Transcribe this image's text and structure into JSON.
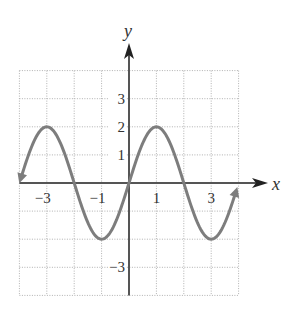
{
  "chart_data": {
    "type": "line",
    "title": "",
    "xlabel": "x",
    "ylabel": "y",
    "xlim": [
      -4,
      4
    ],
    "ylim": [
      -4,
      4
    ],
    "grid": true,
    "grid_style": "dotted",
    "x_tick_labels": [
      {
        "value": -3,
        "label": "−3"
      },
      {
        "value": -1,
        "label": "−1"
      },
      {
        "value": 1,
        "label": "1"
      },
      {
        "value": 3,
        "label": "3"
      }
    ],
    "y_tick_labels": [
      {
        "value": 3,
        "label": "3"
      },
      {
        "value": 2,
        "label": "2"
      },
      {
        "value": 1,
        "label": "1"
      },
      {
        "value": -3,
        "label": "−3"
      }
    ],
    "series": [
      {
        "name": "y = 2 sin(πx/2)",
        "function": "2*sin(pi*x/2)",
        "x_range": [
          -3.95,
          3.9
        ],
        "arrows_at_ends": true,
        "key_points": [
          {
            "x": -3,
            "y": 2
          },
          {
            "x": -2,
            "y": 0
          },
          {
            "x": -1,
            "y": -2
          },
          {
            "x": 0,
            "y": 0
          },
          {
            "x": 1,
            "y": 2
          },
          {
            "x": 2,
            "y": 0
          },
          {
            "x": 3,
            "y": -2
          }
        ]
      }
    ],
    "colors": {
      "curve": "#7d7d7d",
      "axes": "#555555",
      "grid": "#b0b0b0",
      "text": "#333333"
    }
  }
}
